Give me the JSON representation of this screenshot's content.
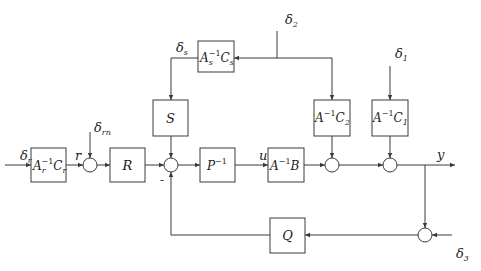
{
  "diagram": {
    "type": "control block diagram",
    "blocks": {
      "Ar_inv_Cr": {
        "base": "A",
        "sub": "r",
        "sup": "−1",
        "base2": "C",
        "sub2": "r"
      },
      "R": {
        "label": "R"
      },
      "S": {
        "label": "S"
      },
      "As_inv_Cs": {
        "base": "A",
        "sub": "s",
        "sup": "−1",
        "base2": "C",
        "sub2": "s"
      },
      "P_inv": {
        "base": "P",
        "sup": "−1"
      },
      "A_inv_B": {
        "base": "A",
        "sup": "−1",
        "base2": "B"
      },
      "A_inv_C2": {
        "base": "A",
        "sup": "−1",
        "base2": "C",
        "sub2": "2"
      },
      "A_inv_C1": {
        "base": "A",
        "sup": "−1",
        "base2": "C",
        "sub2": "1"
      },
      "Q": {
        "label": "Q"
      }
    },
    "signals": {
      "delta_r": {
        "base": "δ",
        "sub": "r"
      },
      "r": "r",
      "delta_rn": {
        "base": "δ",
        "sub": "rn"
      },
      "delta_s": {
        "base": "δ",
        "sub": "s"
      },
      "delta_2": {
        "base": "δ",
        "sub": "2"
      },
      "delta_1": {
        "base": "δ",
        "sub": "1"
      },
      "delta_3": {
        "base": "δ",
        "sub": "3"
      },
      "u": "u",
      "y": "y",
      "minus_sign": "-"
    },
    "summing_junctions": 5,
    "colors": {
      "stroke": "#3a3a3a",
      "background": "#ffffff"
    }
  }
}
